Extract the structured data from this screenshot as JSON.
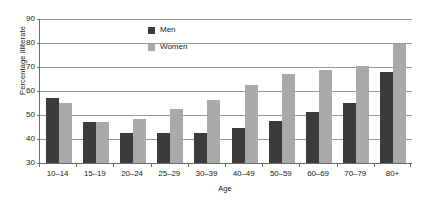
{
  "chart_data": {
    "type": "bar",
    "title": "",
    "xlabel": "Age",
    "ylabel": "Percentage Illiterate",
    "ylim": [
      30,
      90
    ],
    "yticks": [
      30,
      40,
      50,
      60,
      70,
      80,
      90
    ],
    "grid": true,
    "legend_position": "inside-top-left",
    "categories": [
      "10–14",
      "15–19",
      "20–24",
      "25–29",
      "30–39",
      "40–49",
      "50–59",
      "60–69",
      "70–79",
      "80+"
    ],
    "series": [
      {
        "name": "Men",
        "color": "#3b3b3b",
        "values": [
          57.2,
          47.2,
          42.3,
          42.3,
          42.4,
          44.7,
          47.5,
          51.3,
          54.8,
          68.1
        ]
      },
      {
        "name": "Women",
        "color": "#a9a9a9",
        "values": [
          55.2,
          46.9,
          48.5,
          52.4,
          56.2,
          62.3,
          66.9,
          68.9,
          70.4,
          79.4
        ]
      }
    ]
  },
  "axes": {
    "y_title": "Percentage Illiterate",
    "x_title": "Age",
    "y_tick_labels": [
      "90",
      "80",
      "70",
      "60",
      "50",
      "40",
      "30"
    ],
    "x_tick_labels": [
      "10–14",
      "15–19",
      "20–24",
      "25–29",
      "30–39",
      "40–49",
      "50–59",
      "60–69",
      "70–79",
      "80+"
    ]
  },
  "legend": {
    "entries": [
      {
        "label": "Men",
        "color": "#3b3b3b"
      },
      {
        "label": "Women",
        "color": "#a9a9a9"
      }
    ]
  },
  "colors": {
    "men": "#3b3b3b",
    "women": "#a9a9a9",
    "gridline": "#9a9a9a",
    "axis": "#6b6b6b",
    "text": "#1a1a1a",
    "background": "#ffffff"
  }
}
